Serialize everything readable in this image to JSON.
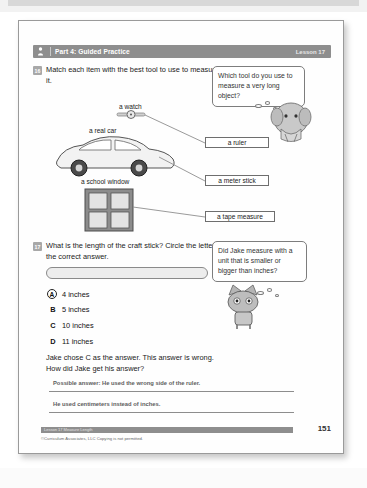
{
  "header": {
    "icon": "person-icon",
    "title": "Part 4: Guided Practice",
    "lesson": "Lesson 17"
  },
  "question16": {
    "number": "16",
    "text": "Match each item with the best tool to use to measure it.",
    "bubble": "Which tool do you use to measure a very long object?",
    "character": "elephant-character",
    "items": [
      {
        "label": "a watch",
        "name": "item-a-watch"
      },
      {
        "label": "a real car",
        "name": "item-a-real-car"
      },
      {
        "label": "a school window",
        "name": "item-a-school-window"
      }
    ],
    "tools": [
      {
        "label": "a ruler",
        "name": "tool-a-ruler"
      },
      {
        "label": "a meter stick",
        "name": "tool-a-meter-stick"
      },
      {
        "label": "a tape measure",
        "name": "tool-a-tape-measure"
      }
    ]
  },
  "question17": {
    "number": "17",
    "text": "What is the length of the craft stick? Circle the letter of the correct answer.",
    "bubble": "Did Jake measure with a unit that is smaller or bigger than inches?",
    "character": "cat-character",
    "choices": [
      {
        "letter": "A",
        "text": "4 inches",
        "circled": true
      },
      {
        "letter": "B",
        "text": "5 inches",
        "circled": false
      },
      {
        "letter": "C",
        "text": "10 inches",
        "circled": false
      },
      {
        "letter": "D",
        "text": "11 inches",
        "circled": false
      }
    ],
    "followup": "Jake chose C as the answer. This answer is wrong. How did Jake get his answer?",
    "answer_lines": [
      "Possible answer: He used the wrong side of the ruler.",
      "He used centimeters instead of inches."
    ]
  },
  "footer": {
    "bar_label": "Lesson 17  Measure Length",
    "page": "151",
    "copyright": "©Curriculum Associates, LLC   Copying is not permitted."
  },
  "colors": {
    "header_bar": "#8e8e8e",
    "badge": "#a8a8a8",
    "ink": "#1a1a1a",
    "handwriting": "#5d5d5d"
  }
}
